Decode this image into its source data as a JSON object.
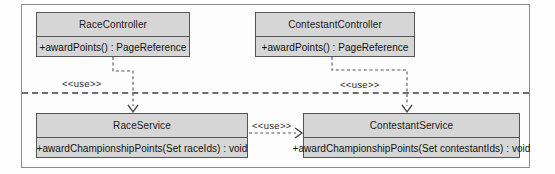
{
  "diagram": {
    "type": "uml-class-diagram",
    "title": "",
    "frame": {
      "visible": true
    },
    "layer_separator": {
      "visible": true,
      "style": "dashed"
    },
    "classes": [
      {
        "id": "race-controller",
        "name": "RaceController",
        "operations": [
          "+awardPoints() : PageReference"
        ],
        "layer": "controller"
      },
      {
        "id": "contestant-controller",
        "name": "ContestantController",
        "operations": [
          "+awardPoints() : PageReference"
        ],
        "layer": "controller"
      },
      {
        "id": "race-service",
        "name": "RaceService",
        "operations": [
          "+awardChampionshipPoints(Set raceIds) : void"
        ],
        "layer": "service"
      },
      {
        "id": "contestant-service",
        "name": "ContestantService",
        "operations": [
          "+awardChampionshipPoints(Set contestantIds) : void"
        ],
        "layer": "service"
      }
    ],
    "dependencies": [
      {
        "id": "dep-race-controller-race-service",
        "from": "RaceController",
        "to": "RaceService",
        "stereotype": "<<use>>",
        "style": "dashed-open-arrow"
      },
      {
        "id": "dep-contestant-controller-contestant-service",
        "from": "ContestantController",
        "to": "ContestantService",
        "stereotype": "<<use>>",
        "style": "dashed-open-arrow"
      },
      {
        "id": "dep-race-service-contestant-service",
        "from": "RaceService",
        "to": "ContestantService",
        "stereotype": "<<use>>",
        "style": "dashed-open-arrow"
      }
    ],
    "colors": {
      "class_fill": "#d6d6d6",
      "class_border": "#555555",
      "frame_border": "#8b8b8b",
      "edge": "#555555",
      "separator": "#6e6e6e",
      "background": "#fefefe",
      "text": "#1a1a1a"
    }
  }
}
